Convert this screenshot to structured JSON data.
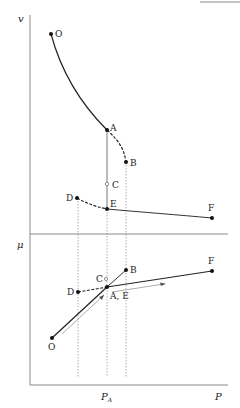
{
  "top_rule": {
    "x1": 200,
    "x2": 240,
    "y": 2
  },
  "axes": {
    "upper_ylabel": "v",
    "lower_ylabel": "μ",
    "xlabel": "P",
    "xtick_label": "P",
    "xtick_sub": "A",
    "colors": {
      "axis": "#8a8a8a",
      "curve": "#222222",
      "guide": "#9a9a9a"
    }
  },
  "upper_panel": {
    "points": [
      {
        "id": "O",
        "label": "O",
        "x": 51,
        "y": 34
      },
      {
        "id": "A",
        "label": "A",
        "x": 107,
        "y": 130
      },
      {
        "id": "B",
        "label": "B",
        "x": 126,
        "y": 162
      },
      {
        "id": "C",
        "label": "C",
        "x": 107,
        "y": 184
      },
      {
        "id": "D",
        "label": "D",
        "x": 77,
        "y": 198
      },
      {
        "id": "E",
        "label": "E",
        "x": 107,
        "y": 209
      },
      {
        "id": "F",
        "label": "F",
        "x": 212,
        "y": 218
      }
    ]
  },
  "lower_panel": {
    "points": [
      {
        "id": "O",
        "label": "O",
        "x": 52,
        "y": 338
      },
      {
        "id": "D",
        "label": "D",
        "x": 78,
        "y": 292
      },
      {
        "id": "C",
        "label": "C",
        "x": 106,
        "y": 280
      },
      {
        "id": "AE",
        "label": "A, E",
        "x": 107,
        "y": 287
      },
      {
        "id": "B",
        "label": "B",
        "x": 126,
        "y": 270
      },
      {
        "id": "F",
        "label": "F",
        "x": 212,
        "y": 271
      }
    ]
  }
}
